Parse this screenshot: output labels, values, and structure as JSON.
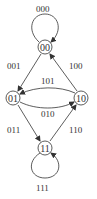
{
  "diagram": {
    "type": "state-transition-graph",
    "nodes": [
      {
        "id": "00",
        "label": "00"
      },
      {
        "id": "01",
        "label": "01"
      },
      {
        "id": "10",
        "label": "10"
      },
      {
        "id": "11",
        "label": "11"
      }
    ],
    "edges": [
      {
        "from": "00",
        "to": "00",
        "label": "000"
      },
      {
        "from": "00",
        "to": "01",
        "label": "001"
      },
      {
        "from": "10",
        "to": "00",
        "label": "100"
      },
      {
        "from": "10",
        "to": "01",
        "label": "101"
      },
      {
        "from": "01",
        "to": "10",
        "label": "010"
      },
      {
        "from": "01",
        "to": "11",
        "label": "011"
      },
      {
        "from": "11",
        "to": "10",
        "label": "110"
      },
      {
        "from": "11",
        "to": "11",
        "label": "111"
      }
    ],
    "colors": {
      "stroke": "#333333",
      "background": "#ffffff"
    }
  }
}
